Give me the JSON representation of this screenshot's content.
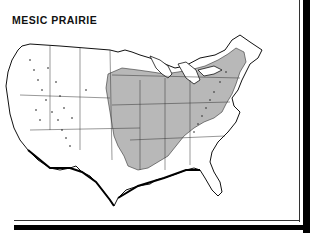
{
  "figure": {
    "title": "MESIC PRAIRIE",
    "type": "distribution-map",
    "region": "Contiguous United States",
    "colors": {
      "shaded_range": "#b8b8b8",
      "outline": "#111111",
      "background": "#ffffff"
    }
  }
}
